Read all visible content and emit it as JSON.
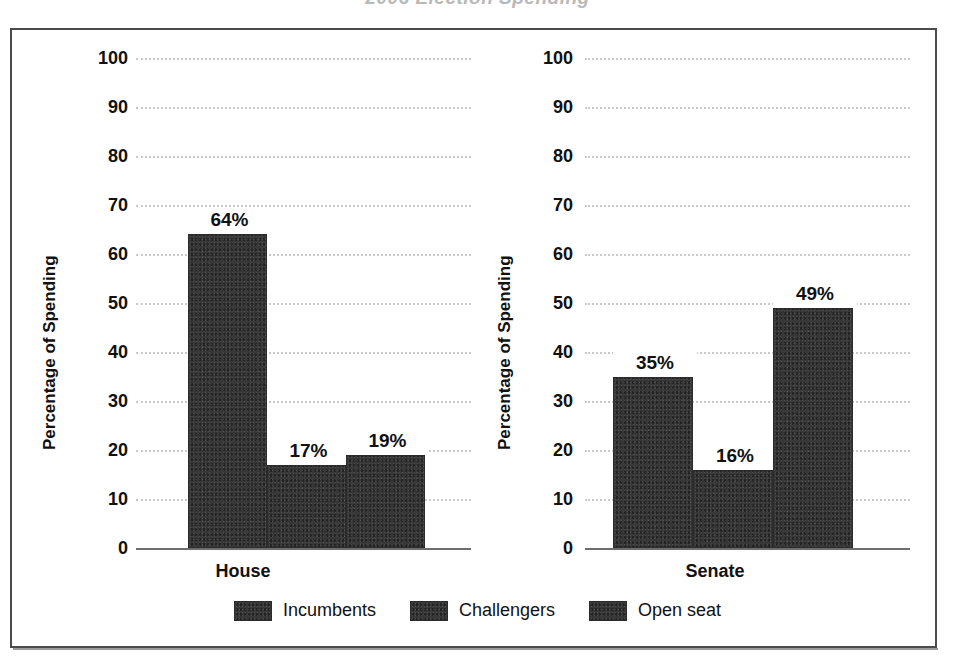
{
  "figure": {
    "title_sliver": "2006 Election Spending",
    "frame_color": "#4b4b4b",
    "bar_color": "#383838",
    "grid_color": "#c9c9c9",
    "axis_color": "#6e6e6e"
  },
  "chart_data": {
    "type": "bar",
    "title": "2006 Election Spending",
    "xlabel": "",
    "ylabel": "Percentage of Spending",
    "ylim": [
      0,
      100
    ],
    "ytick_step": 10,
    "yticks": [
      100,
      90,
      80,
      70,
      60,
      50,
      40,
      30,
      20,
      10,
      0
    ],
    "ytick_labels": [
      "100",
      "90",
      "80",
      "70",
      "60",
      "50",
      "40",
      "30",
      "20",
      "10",
      "0"
    ],
    "grid": true,
    "grid_style": "dotted-horizontal",
    "legend_position": "bottom-center",
    "categories": [
      "Incumbents",
      "Challengers",
      "Open seat"
    ],
    "panels": [
      {
        "name": "House",
        "xlabel": "House",
        "ylabel": "Percentage of Spending",
        "values": [
          64,
          17,
          19
        ],
        "value_labels": [
          "64%",
          "17%",
          "19%"
        ]
      },
      {
        "name": "Senate",
        "xlabel": "Senate",
        "ylabel": "Percentage of Spending",
        "values": [
          35,
          16,
          49
        ],
        "value_labels": [
          "35%",
          "16%",
          "49%"
        ]
      }
    ],
    "legend": [
      {
        "label": "Incumbents",
        "color": "#383838"
      },
      {
        "label": "Challengers",
        "color": "#383838"
      },
      {
        "label": "Open seat",
        "color": "#383838"
      }
    ]
  }
}
